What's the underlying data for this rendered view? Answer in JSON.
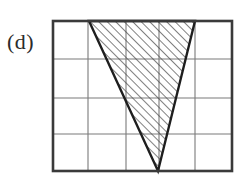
{
  "figure": {
    "label": "(d)",
    "colors": {
      "background": "#ffffff",
      "border": "#3a3a3a",
      "gridline": "#7a7a7a",
      "shape_outline": "#1e1e1e",
      "hatch": "#4a4a4a",
      "label_text": "#2b2b2b"
    },
    "grid": {
      "columns": 5,
      "rows": 4,
      "x_lines": [
        53,
        88,
        126,
        159,
        195,
        232
      ],
      "y_lines": [
        21,
        59,
        98,
        134,
        171
      ],
      "outer_border_width": 2.6,
      "inner_line_width": 1.1
    },
    "shape": {
      "type": "triangle",
      "vertices": [
        {
          "name": "top-left",
          "x": 89,
          "y": 21
        },
        {
          "name": "top-right",
          "x": 195,
          "y": 21
        },
        {
          "name": "bottom-apex",
          "x": 158,
          "y": 171
        }
      ],
      "outline_width": 2.4,
      "fill": "diagonal-hatch",
      "hatch_direction": "bottom-left-to-top-right",
      "hatch_angle_deg": 45,
      "hatch_spacing": 6,
      "hatch_stroke_width": 1.4
    }
  }
}
